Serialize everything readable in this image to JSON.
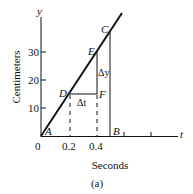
{
  "figure": {
    "caption": "(a)",
    "x_axis": {
      "label": "Seconds",
      "symbol": "t",
      "ticks": [
        "0",
        "0.2",
        "0.4"
      ]
    },
    "y_axis": {
      "label": "Centimeters",
      "symbol": "y",
      "ticks": [
        "10",
        "20",
        "30"
      ]
    },
    "points": {
      "A": "A",
      "B": "B",
      "C": "C",
      "D": "D",
      "E": "E",
      "F": "F"
    },
    "annotations": {
      "delta_t": "Δt",
      "delta_y": "Δy"
    }
  }
}
